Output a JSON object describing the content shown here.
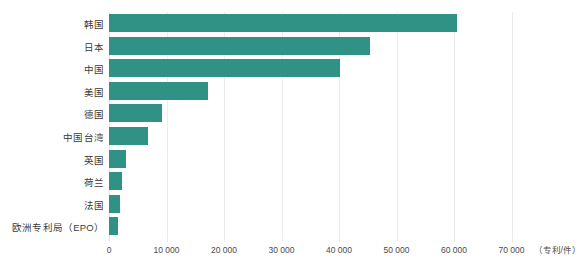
{
  "chart_data": {
    "type": "bar",
    "orientation": "horizontal",
    "title": "",
    "subtitle": "",
    "xlabel": "",
    "ylabel": "",
    "unit_label": "（专利/件）",
    "categories": [
      "韩国",
      "日本",
      "中国",
      "美国",
      "德国",
      "中国台湾",
      "英国",
      "荷兰",
      "法国",
      "欧洲专利局（EPO）"
    ],
    "values": [
      60500,
      45400,
      40200,
      17300,
      9200,
      6800,
      2900,
      2200,
      1900,
      1550
    ],
    "series": [
      {
        "name": "专利数量",
        "color": "#2f9285",
        "values": [
          60500,
          45400,
          40200,
          17300,
          9200,
          6800,
          2900,
          2200,
          1900,
          1550
        ]
      }
    ],
    "xlim": [
      0,
      72000
    ],
    "x_ticks": [
      0,
      10000,
      20000,
      30000,
      40000,
      50000,
      60000,
      70000
    ],
    "x_tick_labels": [
      "0",
      "10 000",
      "20 000",
      "30 000",
      "40 000",
      "50 000",
      "60 000",
      "70 000"
    ],
    "grid": true,
    "grid_axis": "x",
    "legend": false,
    "legend_position": "none",
    "bar_color": "#2f9285",
    "gridline_color": "#ececec",
    "background": "#ffffff"
  }
}
